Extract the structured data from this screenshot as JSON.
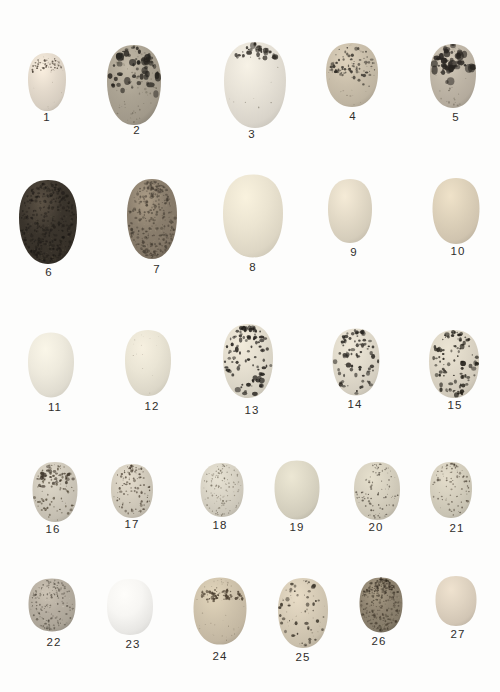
{
  "page": {
    "background": "#fdfdfc",
    "label_color": "#2f2d2b"
  },
  "eggs": [
    {
      "num": 1,
      "label": "1",
      "cx": 47,
      "cy": 82,
      "w": 38,
      "h": 58,
      "round": 0.25,
      "ground": "#e4dacc",
      "hl": 1.1,
      "edge": 0.82,
      "lx": 47,
      "ly": 121,
      "layers": [
        {
          "bias": "band",
          "yc": -0.6,
          "spread": 0.12,
          "count": 65,
          "rmin": 0.3,
          "rmax": 1.1,
          "color": "#463c31",
          "opacity": 0.85
        },
        {
          "bias": "uniform",
          "count": 10,
          "rmin": 0.2,
          "rmax": 0.5,
          "color": "#6b6052",
          "opacity": 0.5
        }
      ]
    },
    {
      "num": 2,
      "label": "2",
      "cx": 134,
      "cy": 85,
      "w": 54,
      "h": 80,
      "round": 0.2,
      "ground": "#aba393",
      "hl": 1.14,
      "edge": 0.74,
      "lx": 137,
      "ly": 134,
      "layers": [
        {
          "bias": "band",
          "yc": -0.38,
          "spread": 0.3,
          "count": 55,
          "rmin": 1.0,
          "rmax": 3.4,
          "color": "#26231e",
          "opacity": 0.85
        },
        {
          "bias": "uniform",
          "count": 70,
          "rmin": 0.3,
          "rmax": 1.0,
          "color": "#514b3d",
          "opacity": 0.45
        }
      ]
    },
    {
      "num": 3,
      "label": "3",
      "cx": 255,
      "cy": 85,
      "w": 62,
      "h": 86,
      "round": 0.2,
      "ground": "#e7e2d7",
      "hl": 1.07,
      "edge": 0.84,
      "lx": 252,
      "ly": 138,
      "layers": [
        {
          "bias": "band",
          "yc": -0.82,
          "spread": 0.1,
          "count": 30,
          "rmin": 0.8,
          "rmax": 2.6,
          "color": "#2e2a24",
          "opacity": 0.9
        },
        {
          "bias": "uniform",
          "count": 14,
          "rmin": 0.3,
          "rmax": 0.7,
          "color": "#55503f",
          "opacity": 0.6
        }
      ]
    },
    {
      "num": 4,
      "label": "4",
      "cx": 352,
      "cy": 75,
      "w": 52,
      "h": 64,
      "round": 0.35,
      "ground": "#cabfab",
      "hl": 1.1,
      "edge": 0.8,
      "lx": 353,
      "ly": 120,
      "layers": [
        {
          "bias": "band",
          "yc": -0.32,
          "spread": 0.25,
          "count": 80,
          "rmin": 0.4,
          "rmax": 1.6,
          "color": "#332f28",
          "opacity": 0.85
        },
        {
          "bias": "uniform",
          "count": 30,
          "rmin": 0.3,
          "rmax": 0.8,
          "color": "#5c5447",
          "opacity": 0.5
        }
      ]
    },
    {
      "num": 5,
      "label": "5",
      "cx": 453,
      "cy": 76,
      "w": 46,
      "h": 64,
      "round": 0.3,
      "ground": "#bfb6a7",
      "hl": 1.12,
      "edge": 0.78,
      "lx": 456,
      "ly": 121,
      "layers": [
        {
          "bias": "band",
          "yc": -0.45,
          "spread": 0.28,
          "count": 45,
          "rmin": 1.0,
          "rmax": 3.8,
          "color": "#282420",
          "opacity": 0.9
        },
        {
          "bias": "uniform",
          "count": 35,
          "rmin": 0.4,
          "rmax": 1.0,
          "color": "#494236",
          "opacity": 0.5
        }
      ]
    },
    {
      "num": 6,
      "label": "6",
      "cx": 48,
      "cy": 222,
      "w": 58,
      "h": 84,
      "round": 0.15,
      "ground": "#3a342c",
      "hl": 1.6,
      "edge": 0.62,
      "lx": 49,
      "ly": 276,
      "layers": [
        {
          "bias": "uniform",
          "count": 340,
          "rmin": 0.5,
          "rmax": 1.5,
          "color": "#191613",
          "opacity": 0.55
        },
        {
          "bias": "uniform",
          "count": 150,
          "rmin": 0.3,
          "rmax": 0.9,
          "color": "#655b4b",
          "opacity": 0.3
        }
      ]
    },
    {
      "num": 7,
      "label": "7",
      "cx": 152,
      "cy": 219,
      "w": 50,
      "h": 80,
      "round": 0.25,
      "ground": "#8a7e6d",
      "hl": 1.25,
      "edge": 0.72,
      "lx": 157,
      "ly": 273,
      "layers": [
        {
          "bias": "uniform",
          "count": 300,
          "rmin": 0.5,
          "rmax": 1.4,
          "color": "#3a332a",
          "opacity": 0.6
        },
        {
          "bias": "uniform",
          "count": 100,
          "rmin": 0.3,
          "rmax": 0.8,
          "color": "#b2a58d",
          "opacity": 0.35
        }
      ]
    },
    {
      "num": 8,
      "label": "8",
      "cx": 253,
      "cy": 216,
      "w": 60,
      "h": 83,
      "round": 0.45,
      "ground": "#ebe4d1",
      "hl": 1.06,
      "edge": 0.85,
      "lx": 253,
      "ly": 271,
      "layers": []
    },
    {
      "num": 9,
      "label": "9",
      "cx": 350,
      "cy": 211,
      "w": 44,
      "h": 64,
      "round": 0.5,
      "ground": "#e3dac7",
      "hl": 1.08,
      "edge": 0.84,
      "lx": 354,
      "ly": 256,
      "layers": []
    },
    {
      "num": 10,
      "label": "10",
      "cx": 456,
      "cy": 211,
      "w": 47,
      "h": 66,
      "round": 0.4,
      "ground": "#ddd1ba",
      "hl": 1.08,
      "edge": 0.82,
      "lx": 458,
      "ly": 255,
      "layers": []
    },
    {
      "num": 11,
      "label": "11",
      "cx": 51,
      "cy": 365,
      "w": 46,
      "h": 65,
      "round": 0.25,
      "ground": "#eeeadd",
      "hl": 1.05,
      "edge": 0.86,
      "lx": 55,
      "ly": 411,
      "layers": []
    },
    {
      "num": 12,
      "label": "12",
      "cx": 148,
      "cy": 363,
      "w": 46,
      "h": 66,
      "round": 0.3,
      "ground": "#eae5d5",
      "hl": 1.05,
      "edge": 0.85,
      "lx": 152,
      "ly": 410,
      "layers": [
        {
          "bias": "uniform",
          "count": 14,
          "rmin": 0.25,
          "rmax": 0.6,
          "color": "#8b8274",
          "opacity": 0.6
        }
      ]
    },
    {
      "num": 13,
      "label": "13",
      "cx": 248,
      "cy": 361,
      "w": 50,
      "h": 74,
      "round": 0.3,
      "ground": "#e4decf",
      "hl": 1.06,
      "edge": 0.83,
      "lx": 252,
      "ly": 414,
      "layers": [
        {
          "bias": "top",
          "count": 95,
          "rmin": 0.7,
          "rmax": 2.2,
          "color": "#221f1b",
          "opacity": 0.9
        }
      ]
    },
    {
      "num": 14,
      "label": "14",
      "cx": 356,
      "cy": 362,
      "w": 47,
      "h": 67,
      "round": 0.4,
      "ground": "#e1dbcc",
      "hl": 1.06,
      "edge": 0.83,
      "lx": 355,
      "ly": 408,
      "layers": [
        {
          "bias": "top",
          "count": 78,
          "rmin": 0.6,
          "rmax": 2.0,
          "color": "#26231e",
          "opacity": 0.9
        }
      ]
    },
    {
      "num": 15,
      "label": "15",
      "cx": 454,
      "cy": 364,
      "w": 50,
      "h": 68,
      "round": 0.35,
      "ground": "#ded7c7",
      "hl": 1.06,
      "edge": 0.82,
      "lx": 455,
      "ly": 409,
      "layers": [
        {
          "bias": "top",
          "count": 100,
          "rmin": 0.6,
          "rmax": 2.2,
          "color": "#232019",
          "opacity": 0.9
        }
      ]
    },
    {
      "num": 16,
      "label": "16",
      "cx": 55,
      "cy": 492,
      "w": 45,
      "h": 60,
      "round": 0.35,
      "ground": "#d0cabc",
      "hl": 1.08,
      "edge": 0.8,
      "lx": 53,
      "ly": 533,
      "layers": [
        {
          "bias": "top",
          "count": 90,
          "rmin": 0.4,
          "rmax": 1.2,
          "color": "#49402f",
          "opacity": 0.8
        },
        {
          "bias": "band",
          "yc": -0.5,
          "spread": 0.22,
          "count": 35,
          "rmin": 0.7,
          "rmax": 1.9,
          "color": "#3a3126",
          "opacity": 0.85
        }
      ]
    },
    {
      "num": 17,
      "label": "17",
      "cx": 132,
      "cy": 491,
      "w": 42,
      "h": 54,
      "round": 0.45,
      "ground": "#d4cdbe",
      "hl": 1.08,
      "edge": 0.81,
      "lx": 132,
      "ly": 528,
      "layers": [
        {
          "bias": "top",
          "count": 100,
          "rmin": 0.4,
          "rmax": 1.2,
          "color": "#473d30",
          "opacity": 0.8
        }
      ]
    },
    {
      "num": 18,
      "label": "18",
      "cx": 222,
      "cy": 490,
      "w": 43,
      "h": 54,
      "round": 0.5,
      "ground": "#d9d4c6",
      "hl": 1.07,
      "edge": 0.82,
      "lx": 220,
      "ly": 529,
      "layers": [
        {
          "bias": "uniform",
          "count": 120,
          "rmin": 0.3,
          "rmax": 0.8,
          "color": "#5a5243",
          "opacity": 0.7
        }
      ]
    },
    {
      "num": 19,
      "label": "19",
      "cx": 297,
      "cy": 490,
      "w": 45,
      "h": 59,
      "round": 0.4,
      "ground": "#ddd8c6",
      "hl": 1.07,
      "edge": 0.82,
      "lx": 297,
      "ly": 531,
      "layers": []
    },
    {
      "num": 20,
      "label": "20",
      "cx": 377,
      "cy": 491,
      "w": 46,
      "h": 58,
      "round": 0.55,
      "ground": "#d7d1c0",
      "hl": 1.07,
      "edge": 0.81,
      "lx": 376,
      "ly": 531,
      "layers": [
        {
          "bias": "uniform",
          "count": 95,
          "rmin": 0.35,
          "rmax": 1.0,
          "color": "#3f382e",
          "opacity": 0.75
        }
      ]
    },
    {
      "num": 21,
      "label": "21",
      "cx": 451,
      "cy": 490,
      "w": 42,
      "h": 56,
      "round": 0.45,
      "ground": "#d5cfbe",
      "hl": 1.07,
      "edge": 0.81,
      "lx": 457,
      "ly": 532,
      "layers": [
        {
          "bias": "top",
          "count": 90,
          "rmin": 0.35,
          "rmax": 1.1,
          "color": "#43392d",
          "opacity": 0.75
        }
      ]
    },
    {
      "num": 22,
      "label": "22",
      "cx": 52,
      "cy": 605,
      "w": 47,
      "h": 53,
      "round": 0.8,
      "ground": "#b6aea1",
      "hl": 1.12,
      "edge": 0.76,
      "lx": 54,
      "ly": 646,
      "layers": [
        {
          "bias": "uniform",
          "count": 170,
          "rmin": 0.4,
          "rmax": 1.0,
          "color": "#3e382e",
          "opacity": 0.6
        },
        {
          "bias": "uniform",
          "count": 55,
          "rmin": 0.25,
          "rmax": 0.7,
          "color": "#d9d2c4",
          "opacity": 0.45
        }
      ]
    },
    {
      "num": 23,
      "label": "23",
      "cx": 130,
      "cy": 607,
      "w": 46,
      "h": 56,
      "round": 0.8,
      "ground": "#f7f6f3",
      "hl": 1.03,
      "edge": 0.87,
      "lx": 133,
      "ly": 648,
      "layers": []
    },
    {
      "num": 24,
      "label": "24",
      "cx": 220,
      "cy": 611,
      "w": 53,
      "h": 67,
      "round": 0.35,
      "ground": "#cfc3ac",
      "hl": 1.09,
      "edge": 0.8,
      "lx": 220,
      "ly": 660,
      "layers": [
        {
          "bias": "band",
          "yc": -0.5,
          "spread": 0.1,
          "count": 70,
          "rmin": 0.4,
          "rmax": 1.5,
          "color": "#45392a",
          "opacity": 0.9
        },
        {
          "bias": "uniform",
          "count": 45,
          "rmin": 0.25,
          "rmax": 0.7,
          "color": "#6e6452",
          "opacity": 0.5
        }
      ]
    },
    {
      "num": 25,
      "label": "25",
      "cx": 303,
      "cy": 613,
      "w": 50,
      "h": 70,
      "round": 0.35,
      "ground": "#d7ccb7",
      "hl": 1.08,
      "edge": 0.8,
      "lx": 303,
      "ly": 661,
      "layers": [
        {
          "bias": "top",
          "count": 50,
          "rmin": 0.5,
          "rmax": 2.0,
          "color": "#362f25",
          "opacity": 0.85
        },
        {
          "bias": "uniform",
          "count": 30,
          "rmin": 0.3,
          "rmax": 0.7,
          "color": "#6a5f4e",
          "opacity": 0.5
        }
      ]
    },
    {
      "num": 26,
      "label": "26",
      "cx": 381,
      "cy": 605,
      "w": 43,
      "h": 55,
      "round": 0.5,
      "ground": "#8e8370",
      "hl": 1.2,
      "edge": 0.7,
      "lx": 379,
      "ly": 645,
      "layers": [
        {
          "bias": "uniform",
          "count": 230,
          "rmin": 0.4,
          "rmax": 1.2,
          "color": "#3a3226",
          "opacity": 0.6
        },
        {
          "bias": "band",
          "yc": -0.7,
          "spread": 0.2,
          "count": 60,
          "rmin": 0.5,
          "rmax": 1.4,
          "color": "#2e271d",
          "opacity": 0.7
        },
        {
          "bias": "uniform",
          "count": 60,
          "rmin": 0.25,
          "rmax": 0.7,
          "color": "#b0a48c",
          "opacity": 0.4
        }
      ]
    },
    {
      "num": 27,
      "label": "27",
      "cx": 456,
      "cy": 601,
      "w": 41,
      "h": 50,
      "round": 0.6,
      "ground": "#dfd3c1",
      "hl": 1.07,
      "edge": 0.83,
      "lx": 458,
      "ly": 638,
      "layers": []
    }
  ]
}
